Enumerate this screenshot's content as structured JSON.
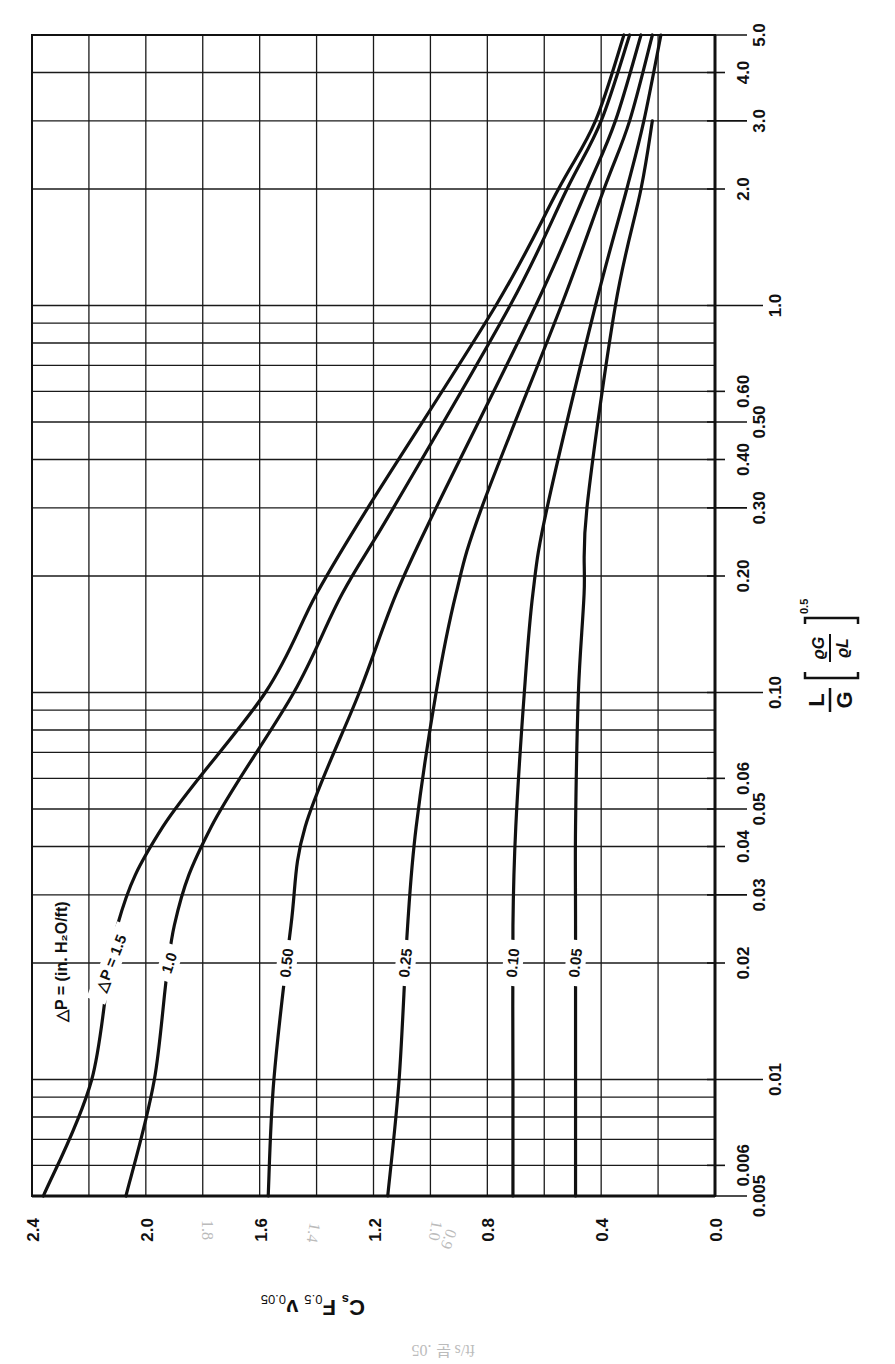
{
  "chart_data": {
    "type": "line",
    "orientation": "rotated: x-axis runs vertically on right edge (bottom→top), y-axis runs horizontally along bottom (right→left)",
    "xlabel": "L/G [ρG/ρL]^0.5",
    "xlabel_parts": {
      "numerator": "L",
      "denominator": "G",
      "bracket_num": "ϱG",
      "bracket_den": "ϱL",
      "exponent": "0.5"
    },
    "ylabel": "Cs F0.5 ν0.05",
    "ylabel_parts": {
      "c": "C",
      "c_sub": "s",
      "f": "F",
      "f_sub": "0.5",
      "v": "ν",
      "v_sub": "0.05"
    },
    "xscale": "log",
    "xlim": [
      0.005,
      5.0
    ],
    "ylim": [
      0.0,
      2.4
    ],
    "x_ticks": [
      "0.005",
      "0.006",
      "0.01",
      "0.02",
      "0.03",
      "0.04",
      "0.05",
      "0.06",
      "0.10",
      "0.20",
      "0.30",
      "0.40",
      "0.50",
      "0.60",
      "1.0",
      "2.0",
      "3.0",
      "4.0",
      "5.0"
    ],
    "x_tick_values": [
      0.005,
      0.006,
      0.01,
      0.02,
      0.03,
      0.04,
      0.05,
      0.06,
      0.1,
      0.2,
      0.3,
      0.4,
      0.5,
      0.6,
      1.0,
      2.0,
      3.0,
      4.0,
      5.0
    ],
    "x_gridlines": [
      0.005,
      0.006,
      0.007,
      0.008,
      0.009,
      0.01,
      0.02,
      0.03,
      0.04,
      0.05,
      0.06,
      0.07,
      0.08,
      0.09,
      0.1,
      0.2,
      0.3,
      0.4,
      0.5,
      0.6,
      0.7,
      0.8,
      0.9,
      1.0,
      2.0,
      3.0,
      4.0,
      5.0
    ],
    "y_ticks": [
      "2.4",
      "2.0",
      "1.6",
      "1.2",
      "0.8",
      "0.4",
      "0.0"
    ],
    "y_tick_values": [
      2.4,
      2.0,
      1.6,
      1.2,
      0.8,
      0.4,
      0.0
    ],
    "y_gridlines": [
      0.0,
      0.2,
      0.4,
      0.6,
      0.8,
      1.0,
      1.2,
      1.4,
      1.6,
      1.8,
      2.0,
      2.2,
      2.4
    ],
    "grid": true,
    "legend_title": "△P = (in. H₂O/ft)",
    "x": [
      0.005,
      0.01,
      0.025,
      0.045,
      0.1,
      0.18,
      0.3,
      1.0,
      2.0,
      3.0,
      5.0
    ],
    "series": [
      {
        "name": "△P = 1.5",
        "label": "△P = 1.5",
        "values": [
          2.36,
          2.19,
          2.1,
          1.94,
          1.58,
          1.4,
          1.22,
          0.77,
          0.55,
          0.42,
          0.32
        ]
      },
      {
        "name": "1.0",
        "label": "1.0",
        "values": [
          2.07,
          1.97,
          1.9,
          1.77,
          1.48,
          1.31,
          1.13,
          0.72,
          0.52,
          0.4,
          0.3
        ]
      },
      {
        "name": "0.50",
        "label": "0.50",
        "values": [
          1.57,
          1.55,
          1.49,
          1.44,
          1.25,
          1.12,
          0.98,
          0.63,
          0.45,
          0.35,
          0.26
        ]
      },
      {
        "name": "0.25",
        "label": "0.25",
        "values": [
          1.15,
          1.11,
          1.08,
          1.05,
          0.98,
          0.91,
          0.82,
          0.54,
          0.39,
          0.3,
          0.22
        ]
      },
      {
        "name": "0.10",
        "label": "0.10",
        "values": [
          0.71,
          0.71,
          0.71,
          0.7,
          0.67,
          0.64,
          0.59,
          0.42,
          0.31,
          0.25,
          0.19
        ]
      },
      {
        "name": "0.05",
        "label": "0.05",
        "values": [
          0.49,
          0.49,
          0.49,
          0.49,
          0.48,
          0.46,
          0.45,
          0.35,
          0.26,
          0.22,
          null
        ]
      }
    ],
    "label_positions": [
      {
        "series": "△P = 1.5",
        "x": 0.02
      },
      {
        "series": "1.0",
        "x": 0.02
      },
      {
        "series": "0.50",
        "x": 0.02
      },
      {
        "series": "0.25",
        "x": 0.02
      },
      {
        "series": "0.10",
        "x": 0.02
      },
      {
        "series": "0.05",
        "x": 0.02
      }
    ],
    "handwritten_annotations": [
      "1.8",
      "1.4",
      "1.0",
      "0.9",
      "ft/s 분 .05"
    ]
  },
  "colors": {
    "ink": "#111111",
    "grid": "#1a1a1a",
    "background": "#ffffff",
    "pencil": "#bbbbbb"
  }
}
